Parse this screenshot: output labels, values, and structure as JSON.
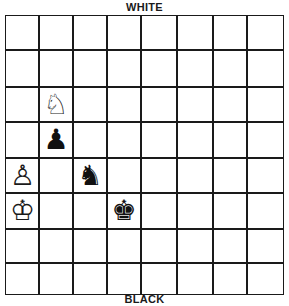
{
  "labels": {
    "top": "WHITE",
    "bottom": "BLACK"
  },
  "board": {
    "rows": 8,
    "cols": 8,
    "col_lines_x": [
      0,
      33,
      67,
      101,
      135,
      171,
      207,
      241,
      279
    ],
    "row_lines_y": [
      0,
      34,
      71,
      106,
      142,
      177,
      213,
      247,
      280
    ],
    "pieces": [
      {
        "name": "white-knight",
        "color": "white",
        "type": "knight",
        "glyph": "♘",
        "row": 2,
        "col": 1
      },
      {
        "name": "black-pawn",
        "color": "black",
        "type": "pawn",
        "glyph": "♟",
        "row": 3,
        "col": 1
      },
      {
        "name": "white-pawn",
        "color": "white",
        "type": "pawn",
        "glyph": "♙",
        "row": 4,
        "col": 0
      },
      {
        "name": "black-knight",
        "color": "black",
        "type": "knight",
        "glyph": "♞",
        "row": 4,
        "col": 2
      },
      {
        "name": "white-king",
        "color": "white",
        "type": "king",
        "glyph": "♔",
        "row": 5,
        "col": 0
      },
      {
        "name": "black-king",
        "color": "black",
        "type": "king",
        "glyph": "♚",
        "row": 5,
        "col": 3
      }
    ]
  }
}
